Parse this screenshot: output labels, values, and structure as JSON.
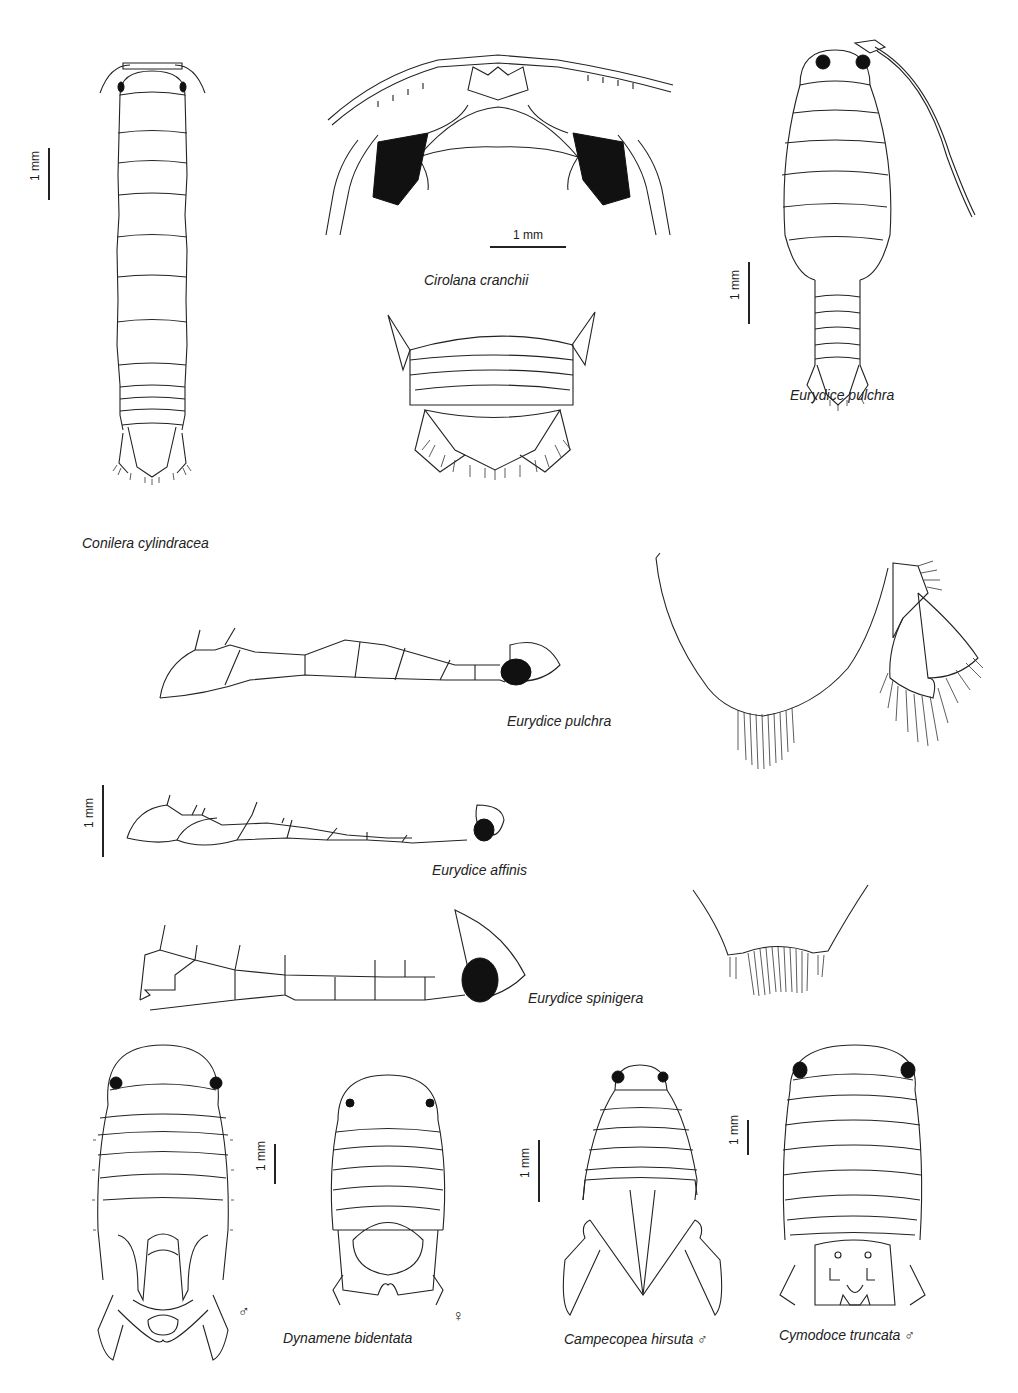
{
  "page": {
    "header_fragment": "",
    "background": "#ffffff",
    "ink_color": "#222222"
  },
  "figures": {
    "conilera": {
      "caption": "Conilera cylindracea",
      "scale_label": "1 mm"
    },
    "cirolana": {
      "caption": "Cirolana cranchii",
      "scale_label": "1 mm"
    },
    "eurydice_pulchra_dorsal": {
      "caption": "Eurydice pulchra",
      "scale_label": "1 mm"
    },
    "pleotelson_detail": {
      "caption": ""
    },
    "eurydice_pulchra_antenna": {
      "caption": "Eurydice pulchra"
    },
    "telson_uropod_detail": {
      "caption": ""
    },
    "eurydice_affinis": {
      "caption": "Eurydice affinis",
      "scale_label": "1 mm"
    },
    "eurydice_spinigera": {
      "caption": "Eurydice spinigera"
    },
    "spinigera_telson_detail": {
      "caption": ""
    },
    "dynamene": {
      "caption": "Dynamene bidentata",
      "scale_label": "1 mm",
      "male_symbol": "♂",
      "female_symbol": "♀"
    },
    "campecopea": {
      "caption": "Campecopea hirsuta ♂",
      "scale_label": "1 mm"
    },
    "cymodoce": {
      "caption": "Cymodoce truncata ♂",
      "scale_label": "1 mm"
    }
  }
}
